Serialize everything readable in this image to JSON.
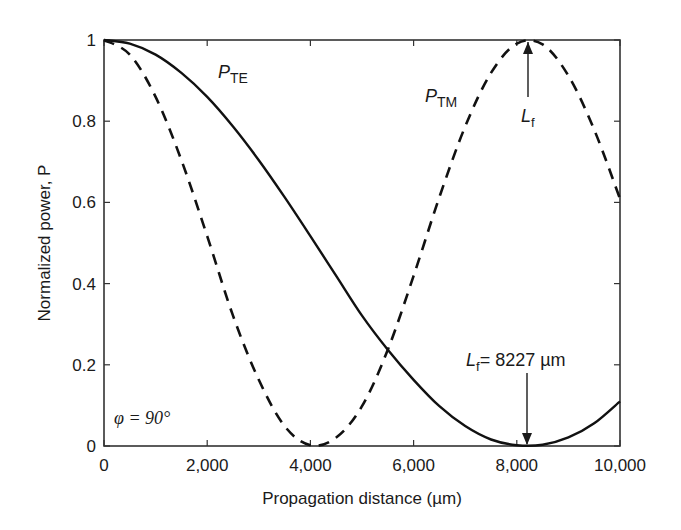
{
  "chart_data": {
    "type": "line",
    "title": "",
    "xlabel": "Propagation distance (µm)",
    "ylabel": "Normalized power, P",
    "xlim": [
      0,
      10000
    ],
    "ylim": [
      0,
      1
    ],
    "grid": false,
    "legend_position": "none (inline curve labels)",
    "x_ticks": [
      0,
      2000,
      4000,
      6000,
      8000,
      10000
    ],
    "x_tick_labels": [
      "0",
      "2,000",
      "4,000",
      "6,000",
      "8,000",
      "10,000"
    ],
    "y_ticks": [
      0,
      0.2,
      0.4,
      0.6,
      0.8,
      1
    ],
    "y_tick_labels": [
      "0",
      "0.2",
      "0.4",
      "0.6",
      "0.8",
      "1"
    ],
    "x": [
      0,
      500,
      1000,
      1500,
      2000,
      2500,
      3000,
      3500,
      4000,
      4500,
      5000,
      5500,
      6000,
      6500,
      7000,
      7500,
      8000,
      8500,
      9000,
      9500,
      10000
    ],
    "series": [
      {
        "name": "P_TE",
        "label_main": "P",
        "label_sub": "TE",
        "style": "solid",
        "values": [
          1.0,
          0.991,
          0.964,
          0.919,
          0.86,
          0.787,
          0.704,
          0.613,
          0.517,
          0.419,
          0.321,
          0.237,
          0.163,
          0.098,
          0.049,
          0.016,
          0.002,
          0.003,
          0.021,
          0.056,
          0.11
        ]
      },
      {
        "name": "P_TM",
        "label_main": "P",
        "label_sub": "TM",
        "style": "dashed",
        "values": [
          1.0,
          0.964,
          0.86,
          0.704,
          0.517,
          0.321,
          0.163,
          0.049,
          0.002,
          0.021,
          0.098,
          0.237,
          0.419,
          0.613,
          0.787,
          0.919,
          0.991,
          0.989,
          0.912,
          0.779,
          0.609
        ]
      }
    ],
    "annotations": [
      {
        "text_main": "L",
        "text_sub": "f",
        "at_x": 8227,
        "at_y": 1.0,
        "arrow": "up",
        "description": "Arrow to P_TM maximum"
      },
      {
        "text_main": "L",
        "text_sub": "f",
        "text_rest": "= 8227 µm",
        "at_x": 8227,
        "at_y": 0.0,
        "arrow": "down",
        "description": "Arrow to P_TE minimum"
      },
      {
        "text": "φ = 90°",
        "position": "lower-left inside plot"
      }
    ],
    "coupling_length_um": 8227,
    "phi_deg": 90
  },
  "labels": {
    "xlabel": "Propagation distance (µm)",
    "ylabel": "Normalized power, P",
    "te_main": "P",
    "te_sub": "TE",
    "tm_main": "P",
    "tm_sub": "TM",
    "lf_main": "L",
    "lf_sub": "f",
    "lf_value": "= 8227 µm",
    "phi": "φ = 90°"
  }
}
